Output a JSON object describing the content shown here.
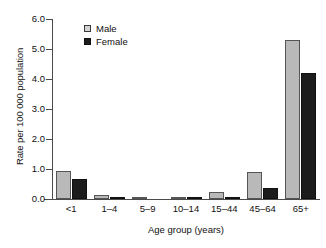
{
  "chart_data": {
    "type": "bar",
    "title": "",
    "xlabel": "Age group (years)",
    "ylabel": "Rate per 100 000 population",
    "categories": [
      "<1",
      "1–4",
      "5–9",
      "10–14",
      "15–44",
      "45–64",
      "65+"
    ],
    "series": [
      {
        "name": "Male",
        "color": "#b9b9b9",
        "values": [
          0.95,
          0.12,
          0.03,
          0.03,
          0.23,
          0.9,
          5.3
        ]
      },
      {
        "name": "Female",
        "color": "#1c1c1c",
        "values": [
          0.67,
          0.05,
          0.0,
          0.07,
          0.05,
          0.38,
          4.2
        ]
      }
    ],
    "ylim": [
      0.0,
      6.0
    ],
    "ytick_values": [
      0.0,
      1.0,
      2.0,
      3.0,
      4.0,
      5.0,
      6.0
    ],
    "ytick_labels": [
      "0.0",
      "1.0",
      "2.0",
      "3.0",
      "4.0",
      "5.0",
      "6.0"
    ],
    "grid": false,
    "legend_position": "top-left"
  },
  "legend": {
    "items": [
      {
        "label": "Male"
      },
      {
        "label": "Female"
      }
    ]
  },
  "axes": {
    "x_title": "Age group (years)",
    "y_title": "Rate per 100 000 population"
  }
}
